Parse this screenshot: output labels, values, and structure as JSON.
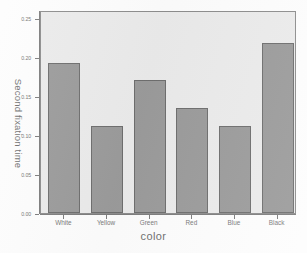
{
  "chart_data": {
    "type": "bar",
    "title": "",
    "xlabel": "color",
    "ylabel": "Second fixation time",
    "categories": [
      "White",
      "Yellow",
      "Green",
      "Red",
      "Blue",
      "Black"
    ],
    "values": [
      0.192,
      0.112,
      0.17,
      0.134,
      0.112,
      0.218
    ],
    "ylim": [
      0.0,
      0.26
    ],
    "yticks": [
      0.0,
      0.05,
      0.1,
      0.15,
      0.2,
      0.25
    ],
    "ytick_labels": [
      "0.00",
      "0.05",
      "0.10",
      "0.15",
      "0.20",
      "0.25"
    ],
    "grid": false,
    "legend": null,
    "bar_color": "#9b9b9b",
    "bar_edge_color": "#6e6e6e",
    "plot_background": "#ebebeb",
    "figure_background": "#fdfdfd"
  }
}
